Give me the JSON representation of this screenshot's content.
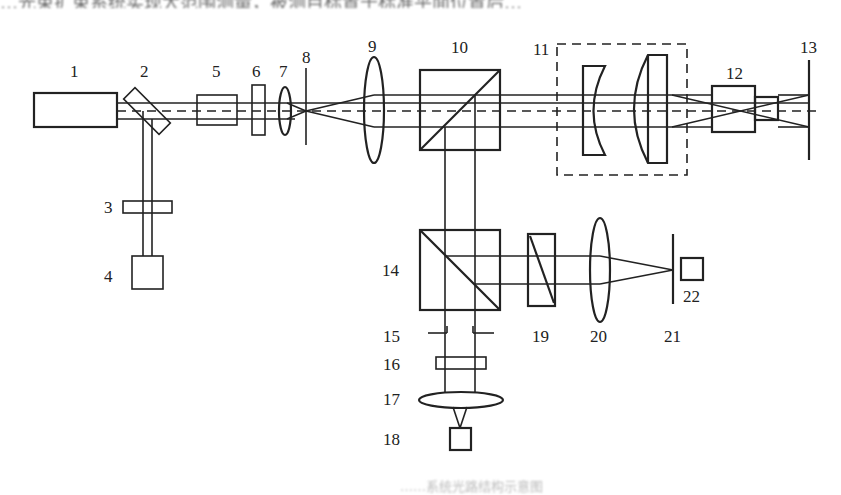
{
  "header_text": "…光束扩束系统实现大范围测量，被测目标置于标准平面位置后…",
  "caption": "……系统光路结构示意图",
  "diagram": {
    "type": "optical-layout",
    "colors": {
      "line": "#222222",
      "background": "#ffffff"
    },
    "labels": {
      "l1": "1",
      "l2": "2",
      "l3": "3",
      "l4": "4",
      "l5": "5",
      "l6": "6",
      "l7": "7",
      "l8": "8",
      "l9": "9",
      "l10": "10",
      "l11": "11",
      "l12": "12",
      "l13": "13",
      "l14": "14",
      "l15": "15",
      "l16": "16",
      "l17": "17",
      "l18": "18",
      "l19": "19",
      "l20": "20",
      "l21": "21",
      "l22": "22"
    },
    "components": [
      {
        "id": 1,
        "shape": "rectangle",
        "role": "light source"
      },
      {
        "id": 2,
        "shape": "tilted plate",
        "role": "beam splitter"
      },
      {
        "id": 3,
        "shape": "plate",
        "role": "wave plate"
      },
      {
        "id": 4,
        "shape": "square",
        "role": "detector"
      },
      {
        "id": 5,
        "shape": "rectangle",
        "role": "optical element"
      },
      {
        "id": 6,
        "shape": "plate",
        "role": "wave plate"
      },
      {
        "id": 7,
        "shape": "lens",
        "role": "focusing lens"
      },
      {
        "id": 8,
        "shape": "line",
        "role": "pinhole"
      },
      {
        "id": 9,
        "shape": "lens",
        "role": "collimating lens"
      },
      {
        "id": 10,
        "shape": "cube",
        "role": "beam splitter cube"
      },
      {
        "id": 11,
        "shape": "dashed box",
        "role": "beam expander (concave + convex lens)"
      },
      {
        "id": 12,
        "shape": "rectangle",
        "role": "objective"
      },
      {
        "id": 13,
        "shape": "line",
        "role": "target plane"
      },
      {
        "id": 14,
        "shape": "cube",
        "role": "beam splitter cube"
      },
      {
        "id": 15,
        "shape": "line",
        "role": "aperture"
      },
      {
        "id": 16,
        "shape": "plate",
        "role": "filter"
      },
      {
        "id": 17,
        "shape": "lens",
        "role": "imaging lens"
      },
      {
        "id": 18,
        "shape": "square",
        "role": "detector"
      },
      {
        "id": 19,
        "shape": "rectangle with diagonal",
        "role": "polarizer"
      },
      {
        "id": 20,
        "shape": "lens",
        "role": "focusing lens"
      },
      {
        "id": 21,
        "shape": "line",
        "role": "pinhole"
      },
      {
        "id": 22,
        "shape": "square",
        "role": "detector"
      }
    ]
  }
}
